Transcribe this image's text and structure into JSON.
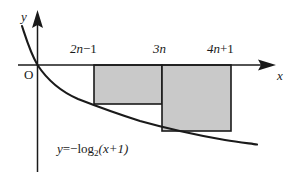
{
  "figure": {
    "kind": "coordinate-plane-diagram",
    "axes": {
      "y_label": "y",
      "x_label": "x",
      "origin_label": "O"
    },
    "x_ticks": [
      {
        "id": "tick-2n-minus-1",
        "coef": "2n",
        "op": "−",
        "const": "1",
        "x_px": 94
      },
      {
        "id": "tick-3n",
        "coef": "3n",
        "op": "",
        "const": "",
        "x_px": 162
      },
      {
        "id": "tick-4n-plus-1",
        "coef": "4n",
        "op": "+",
        "const": "1",
        "x_px": 231
      }
    ],
    "curve": {
      "equation_lhs": "y",
      "equation_eq": "=−",
      "equation_fn": "log",
      "equation_sub": "2",
      "equation_arg": "(x+1)",
      "equation_text": "y=−log₂(x+1)"
    },
    "rectangles": [
      {
        "id": "rect-left",
        "from": "2n−1",
        "to": "3n",
        "x": 94,
        "y": 65,
        "width": 68,
        "height": 39
      },
      {
        "id": "rect-right",
        "from": "3n",
        "to": "4n+1",
        "x": 162,
        "y": 65,
        "width": 69,
        "height": 66
      }
    ],
    "colors": {
      "stroke": "#1a1a1a",
      "fill": "#c9c9c9",
      "background": "#ffffff"
    }
  }
}
